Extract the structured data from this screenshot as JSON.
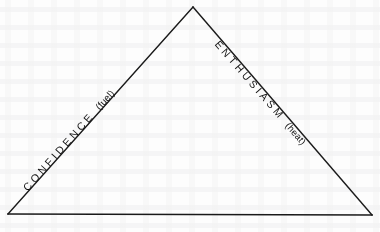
{
  "figure": {
    "type": "triangle-diagram",
    "shape_name": "isosceles-triangle",
    "background_color": "#fdfdfd",
    "stroke_color": "#1a1a1a",
    "stroke_width": 1.4,
    "vertices": {
      "apex": {
        "x": 193,
        "y": 7
      },
      "bottom_left": {
        "x": 8,
        "y": 214
      },
      "bottom_right": {
        "x": 372,
        "y": 215
      }
    },
    "edges": [
      {
        "id": "left-edge",
        "side": "left",
        "label_main": "CONFIDENCE",
        "label_parenthetical": "(fuel)",
        "rotation_deg": -48.35
      },
      {
        "id": "right-edge",
        "side": "right",
        "label_main": "ENTHUSIASM",
        "label_parenthetical": "(heat)",
        "rotation_deg": 49.1
      },
      {
        "id": "base-edge",
        "side": "bottom",
        "label_main": "",
        "label_parenthetical": "",
        "rotation_deg": 0
      }
    ]
  },
  "labels": {
    "left": {
      "main": "CONFIDENCE",
      "paren": "(fuel)"
    },
    "right": {
      "main": "ENTHUSIASM",
      "paren": "(heat)"
    }
  }
}
